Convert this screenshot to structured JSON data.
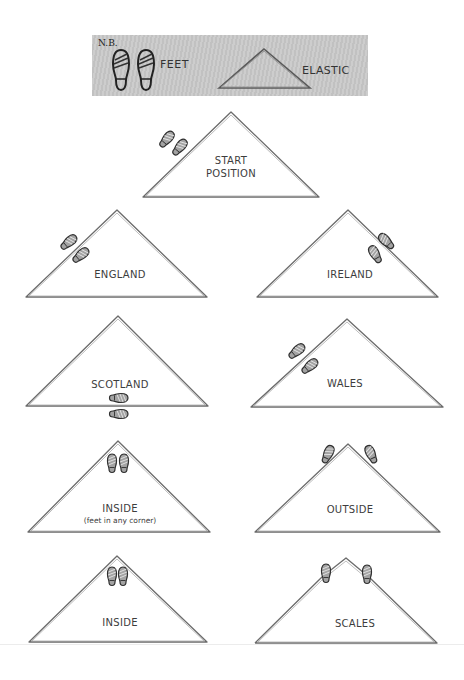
{
  "legend": {
    "note": "N.B.",
    "feet_label": "FEET",
    "elastic_label": "ELASTIC"
  },
  "diagrams": [
    {
      "id": "start",
      "label": "START",
      "label2": "POSITION",
      "feet_position": "outside left side"
    },
    {
      "id": "england",
      "label": "ENGLAND",
      "feet_position": "straddling left side"
    },
    {
      "id": "ireland",
      "label": "IRELAND",
      "feet_position": "straddling right side"
    },
    {
      "id": "scotland",
      "label": "SCOTLAND",
      "feet_position": "straddling base"
    },
    {
      "id": "wales",
      "label": "WALES",
      "feet_position": "straddling left side"
    },
    {
      "id": "inside-any",
      "label": "INSIDE",
      "label2": "(feet in any corner)",
      "feet_position": "inside top corner"
    },
    {
      "id": "outside",
      "label": "OUTSIDE",
      "feet_position": "outside top corner"
    },
    {
      "id": "inside",
      "label": "INSIDE",
      "feet_position": "inside top corner"
    },
    {
      "id": "scales",
      "label": "SCALES",
      "feet_position": "on both sides near apex"
    }
  ],
  "colors": {
    "elastic_line": "#6b6b6b",
    "legend_bg": "#c9c9c9",
    "shoe_fill": "#9a9a9a",
    "shoe_outline": "#333333"
  }
}
